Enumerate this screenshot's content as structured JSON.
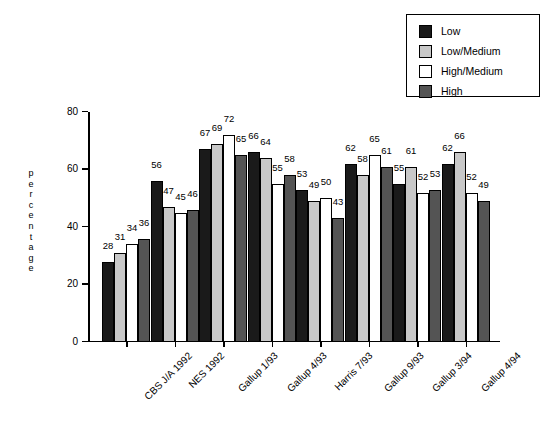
{
  "chart_data": {
    "type": "bar",
    "title": "",
    "xlabel": "",
    "ylabel": "percentage",
    "ylim": [
      0,
      80
    ],
    "yticks": [
      0,
      20,
      40,
      60,
      80
    ],
    "grid": false,
    "legend_position": "top-right",
    "categories": [
      "CBS J/A 1992",
      "NES 1992",
      "Gallup 1/93",
      "Gallup 4/93",
      "Harris 7/93",
      "Gallup 9/93",
      "Gallup 3/94",
      "Gallup 4/94"
    ],
    "series": [
      {
        "name": "Low",
        "color": "#1a1a1a",
        "values": [
          28,
          56,
          67,
          66,
          53,
          62,
          55,
          62
        ]
      },
      {
        "name": "Low/Medium",
        "color": "#c8c8c8",
        "values": [
          31,
          47,
          69,
          64,
          49,
          58,
          61,
          66
        ]
      },
      {
        "name": "High/Medium",
        "color": "#ffffff",
        "values": [
          34,
          45,
          72,
          55,
          50,
          65,
          52,
          52
        ]
      },
      {
        "name": "High",
        "color": "#545454",
        "values": [
          36,
          46,
          65,
          58,
          43,
          61,
          53,
          49
        ]
      }
    ]
  },
  "legend": {
    "items": [
      {
        "label": "Low",
        "color": "#1a1a1a"
      },
      {
        "label": "Low/Medium",
        "color": "#c8c8c8"
      },
      {
        "label": "High/Medium",
        "color": "#ffffff"
      },
      {
        "label": "High",
        "color": "#545454"
      }
    ]
  }
}
